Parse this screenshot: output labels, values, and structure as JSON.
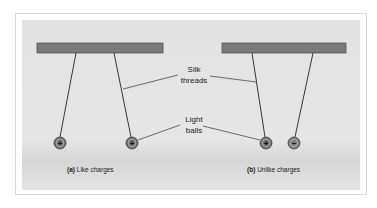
{
  "labels": {
    "silk_line1": "Silk",
    "silk_line2": "threads",
    "balls_line1": "Light",
    "balls_line2": "balls"
  },
  "captions": {
    "a_tag": "(a)",
    "a_text": "Like charges",
    "b_tag": "(b)",
    "b_text": "Unlike charges"
  },
  "charges": {
    "a_left": "+",
    "a_right": "+",
    "b_left": "+",
    "b_right": "−"
  },
  "colors": {
    "bar": "#7a7a7a",
    "ball": "#6e6e6e",
    "panel": "#e4e4e4"
  }
}
